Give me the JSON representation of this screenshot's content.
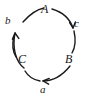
{
  "figure": {
    "type": "cycle-diagram",
    "width": 88,
    "height": 111,
    "background_color": "#ffffff",
    "stroke_color": "#1a1a1a"
  },
  "nodes": [
    {
      "id": "A",
      "label": "A",
      "position": "top"
    },
    {
      "id": "B",
      "label": "B",
      "position": "bottom-right"
    },
    {
      "id": "C",
      "label": "C",
      "position": "bottom-left"
    }
  ],
  "edges": [
    {
      "id": "c",
      "label": "c",
      "from": "A",
      "to": "B",
      "side": "right",
      "arrow": "down"
    },
    {
      "id": "a",
      "label": "a",
      "from": "B",
      "to": "C",
      "side": "bottom",
      "arrow": "left"
    },
    {
      "id": "b",
      "label": "b",
      "from": "C",
      "to": "A",
      "side": "left",
      "arrow": "up"
    }
  ],
  "labels": {
    "node_A": "A",
    "node_B": "B",
    "node_C": "C",
    "edge_a": "a",
    "edge_b": "b",
    "edge_c": "c"
  }
}
